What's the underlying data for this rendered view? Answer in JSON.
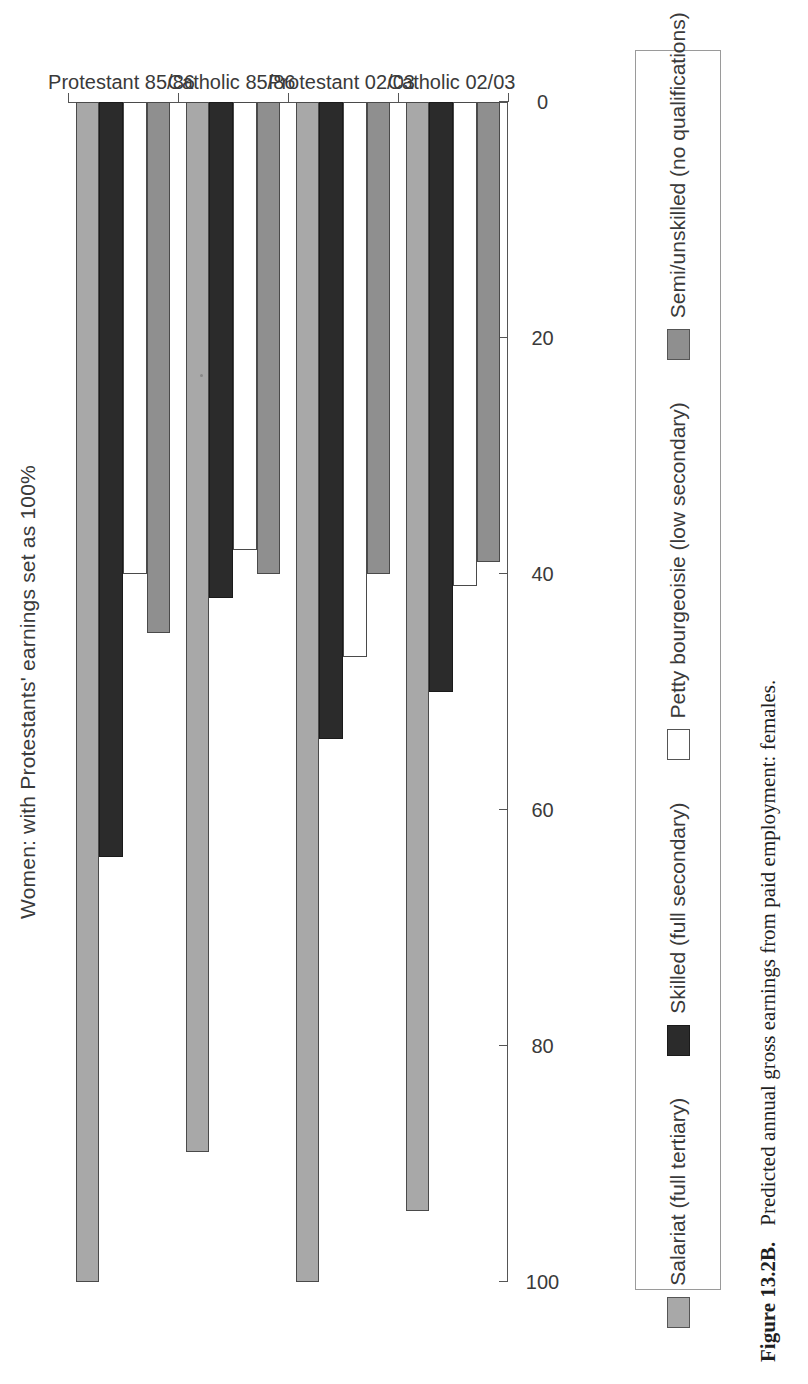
{
  "figure": {
    "label": "Figure 13.2B.",
    "caption": "Predicted annual gross earnings from paid employment: females."
  },
  "chart_data": {
    "type": "bar",
    "orientation": "vertical-grouped",
    "title": "Women: with Protestants' earnings set as 100%",
    "xlabel": "",
    "ylabel": "",
    "ylim": [
      0,
      100
    ],
    "yticks": [
      0,
      20,
      40,
      60,
      80,
      100
    ],
    "ytick_labels": [
      "0",
      "20",
      "40",
      "60",
      "80",
      "100"
    ],
    "grid": false,
    "legend_position": "bottom",
    "categories": [
      "Protestant 85/86",
      "Catholic 85/86",
      "Protestant 02/03",
      "Catholic 02/03"
    ],
    "series": [
      {
        "name": "Salariat (full tertiary)",
        "color": "#a8a8a8",
        "values": [
          100,
          89,
          100,
          94
        ]
      },
      {
        "name": "Skilled (full secondary)",
        "color": "#2b2b2b",
        "values": [
          64,
          42,
          54,
          50
        ]
      },
      {
        "name": "Petty bourgeoisie (low secondary)",
        "color": "#ffffff",
        "values": [
          40,
          38,
          47,
          41
        ]
      },
      {
        "name": "Semi/unskilled (no qualifications)",
        "color": "#8f8f8f",
        "values": [
          45,
          40,
          40,
          39
        ]
      }
    ]
  },
  "legend": {
    "items": [
      {
        "label": "Salariat (full tertiary)",
        "swatch": "s-salariat"
      },
      {
        "label": "Skilled (full secondary)",
        "swatch": "s-skilled"
      },
      {
        "label": "Petty bourgeoisie (low secondary)",
        "swatch": "s-petty"
      },
      {
        "label": "Semi/unskilled (no qualifications)",
        "swatch": "s-semi"
      }
    ]
  },
  "axis": {
    "value_ticks": [
      "0",
      "20",
      "40",
      "60",
      "80",
      "100"
    ],
    "category_ticks": [
      "Protestant 85/86",
      "Catholic 85/86",
      "Protestant 02/03",
      "Catholic 02/03"
    ]
  }
}
